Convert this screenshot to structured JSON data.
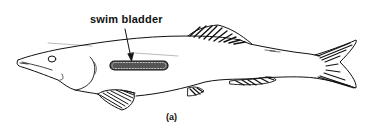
{
  "figure": {
    "labels": {
      "swim_bladder": "swim bladder",
      "caption": "(a)"
    },
    "colors": {
      "ink": "#111111",
      "background": "#ffffff"
    }
  }
}
